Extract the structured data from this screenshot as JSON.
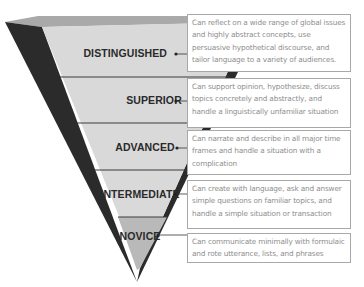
{
  "diagram": {
    "type": "inverted-pyramid",
    "colors": {
      "band_fill": "#d9d9d9",
      "novice_fill": "#b9b9b9",
      "top_face": "#a9a9a9",
      "dark_side": "#2b2b2b",
      "divider": "#3a3a3a",
      "box_border": "#a8a8a8",
      "box_text": "#8e8e8e",
      "label_text": "#2a2a2a"
    },
    "levels": [
      {
        "label": "DISTINGUISHED",
        "description": "Can reflect on a wide range of global issues and highly abstract concepts, use persuasive hypothetical discourse, and tailor language to a variety of audiences."
      },
      {
        "label": "SUPERIOR",
        "description": "Can support opinion, hypothesize, discuss topics concretely and abstractly, and handle a linguistically unfamiliar situation"
      },
      {
        "label": "ADVANCED",
        "description": "Can narrate and describe in all major time frames and handle a situation with a complication"
      },
      {
        "label": "INTERMEDIATE",
        "description": "Can create with language, ask and answer simple questions on familiar topics, and handle a simple situation or transaction"
      },
      {
        "label": "NOVICE",
        "description": "Can communicate minimally with formulaic and rote utterance, lists, and phrases"
      }
    ]
  }
}
